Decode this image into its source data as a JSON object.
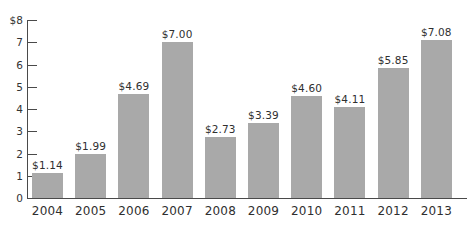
{
  "chart_data": {
    "type": "bar",
    "title": "",
    "subtitle": "",
    "xlabel": "",
    "ylabel": "",
    "categories": [
      "2004",
      "2005",
      "2006",
      "2007",
      "2008",
      "2009",
      "2010",
      "2011",
      "2012",
      "2013"
    ],
    "values": [
      1.14,
      1.99,
      4.69,
      7.0,
      2.73,
      3.39,
      4.6,
      4.11,
      5.85,
      7.08
    ],
    "value_labels": [
      "$1.14",
      "$1.99",
      "$4.69",
      "$7.00",
      "$2.73",
      "$3.39",
      "$4.60",
      "$4.11",
      "$5.85",
      "$7.08"
    ],
    "ylim": [
      0,
      8
    ],
    "ytick_values": [
      8,
      7,
      6,
      5,
      4,
      3,
      2,
      1,
      0
    ],
    "ytick_labels": [
      "$8",
      "7",
      "6",
      "5",
      "4",
      "3",
      "2",
      "1",
      "0"
    ],
    "grid": false,
    "legend": null,
    "bar_color": "#a9a9a9",
    "axis_color": "#4a4a4a",
    "text_color": "#2f2f2f",
    "background_color": "#ffffff"
  }
}
